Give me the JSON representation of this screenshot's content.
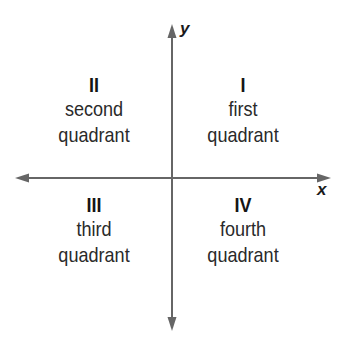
{
  "diagram": {
    "type": "coordinate-plane-quadrants",
    "axes": {
      "x_label": "x",
      "y_label": "y",
      "color": "#666666"
    },
    "quadrants": {
      "first": {
        "numeral": "I",
        "line1": "first",
        "line2": "quadrant"
      },
      "second": {
        "numeral": "II",
        "line1": "second",
        "line2": "quadrant"
      },
      "third": {
        "numeral": "III",
        "line1": "third",
        "line2": "quadrant"
      },
      "fourth": {
        "numeral": "IV",
        "line1": "fourth",
        "line2": "quadrant"
      }
    }
  }
}
